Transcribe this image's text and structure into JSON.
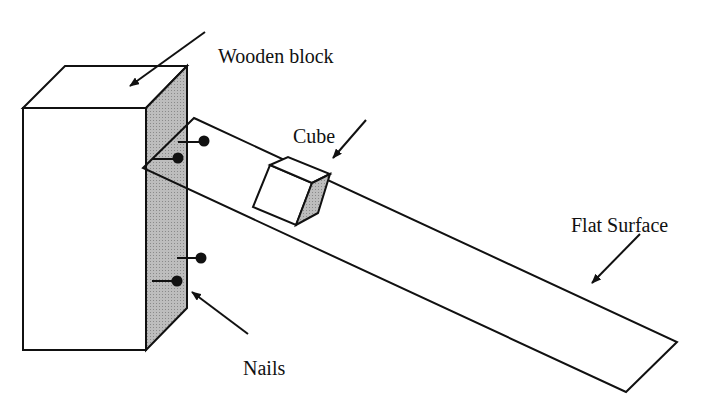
{
  "diagram": {
    "type": "physics-apparatus",
    "labels": {
      "wooden_block": "Wooden block",
      "cube": "Cube",
      "flat_surface": "Flat Surface",
      "nails": "Nails"
    },
    "components": [
      {
        "id": "wooden-block",
        "label": "Wooden block",
        "shape": "rectangular prism",
        "shaded_face": "right side"
      },
      {
        "id": "flat-surface",
        "label": "Flat Surface",
        "shape": "inclined plank",
        "attached_to": "wooden-block"
      },
      {
        "id": "cube",
        "label": "Cube",
        "shape": "cube",
        "resting_on": "flat-surface"
      },
      {
        "id": "nails",
        "label": "Nails",
        "count": 4,
        "attached_to": "wooden-block"
      }
    ],
    "colors": {
      "line": "#111111",
      "shade": "#b3b3b3",
      "background": "#ffffff"
    }
  }
}
